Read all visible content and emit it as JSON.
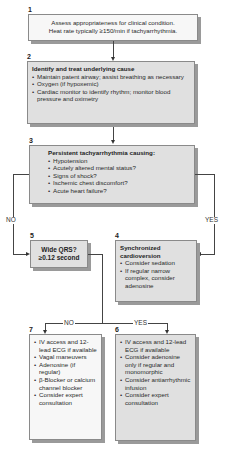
{
  "nodes": {
    "n1": {
      "num": "1",
      "lines": [
        "Assess appropriateness for clinical condition.",
        "Heat rate typically ≥150/min if tachyarrhythmia."
      ]
    },
    "n2": {
      "num": "2",
      "title": "Identify and treat underlying cause",
      "items": [
        "Maintain patent airway; assist breathing as necessary",
        "Oxygen (if hypoxemic)",
        "Cardiac monitor to identify rhythm; monitor blood pressure and oximetry"
      ]
    },
    "n3": {
      "num": "3",
      "title": "Persistent  tachyarrhythmia causing:",
      "items": [
        "Hypotension",
        "Acutely altered mental status?",
        "Signs of shock?",
        "Ischemic chest discomfort?",
        "Acute heart failure?"
      ]
    },
    "n4": {
      "num": "4",
      "title": "Synchronized cardioversion",
      "items": [
        "Consider sedation",
        "If regular narrow complex, consider adenosine"
      ]
    },
    "n5": {
      "num": "5",
      "lines": [
        "Wide QRS?",
        "≥0.12 second"
      ]
    },
    "n6": {
      "num": "6",
      "items": [
        "IV access and 12-lead ECG if available",
        "Consider adenosine only if regular and monomorphic",
        "Consider antiarrhythmic infusion",
        "Consider expert consultation"
      ]
    },
    "n7": {
      "num": "7",
      "items": [
        "IV access and 12-lead ECG if available",
        "Vagal maneuvers",
        "Adenosine (if regular)",
        "β-Blocker or calcium channel blocker",
        "Consider expert consultation"
      ]
    }
  },
  "edges": {
    "n3_no": "NO",
    "n3_yes": "YES",
    "n5_no": "NO",
    "n5_yes": "YES"
  },
  "colors": {
    "box_gray": "#e0e0e0",
    "box_white": "#f7f7f7",
    "line": "#444444"
  }
}
